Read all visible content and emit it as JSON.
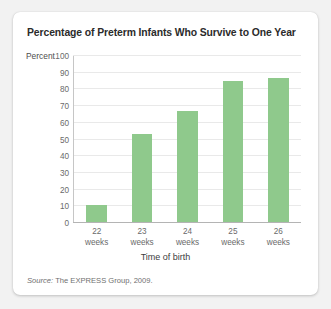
{
  "card": {
    "source_prefix": "Source:",
    "source_text": " The EXPRESS Group, 2009."
  },
  "chart_data": {
    "type": "bar",
    "title": "Percentage of Preterm Infants Who Survive to One Year",
    "categories": [
      "22 weeks",
      "23 weeks",
      "24 weeks",
      "25 weeks",
      "26 weeks"
    ],
    "category_lines": [
      {
        "top": "22",
        "bottom": "weeks"
      },
      {
        "top": "23",
        "bottom": "weeks"
      },
      {
        "top": "24",
        "bottom": "weeks"
      },
      {
        "top": "25",
        "bottom": "weeks"
      },
      {
        "top": "26",
        "bottom": "weeks"
      }
    ],
    "values": [
      10,
      53,
      67,
      85,
      87
    ],
    "xlabel": "Time of birth",
    "ylabel": "Percent",
    "ylim": [
      0,
      100
    ],
    "ytick_step": 10,
    "yticks": [
      100,
      90,
      80,
      70,
      60,
      50,
      40,
      30,
      20,
      10,
      0
    ],
    "grid": true,
    "legend": "none",
    "bar_color": "#8fc98c",
    "gridline_color": "#e9e9e9",
    "axis_color": "#b4b4b4"
  }
}
